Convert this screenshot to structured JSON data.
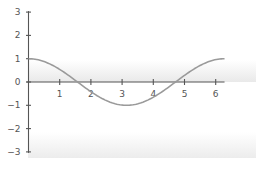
{
  "chart_data": {
    "type": "line",
    "title": "",
    "xlabel": "",
    "ylabel": "",
    "xlim": [
      0,
      6.2832
    ],
    "ylim": [
      -3,
      3
    ],
    "grid": false,
    "legend": null,
    "x_ticks": [
      "1",
      "2",
      "3",
      "4",
      "5",
      "6"
    ],
    "y_ticks": [
      "3",
      "2",
      "1",
      "0",
      "-1",
      "-2",
      "-3"
    ],
    "series": [
      {
        "name": "cos(x)",
        "x": [
          0,
          0.5,
          1,
          1.5708,
          2,
          2.5,
          3.1416,
          3.5,
          4,
          4.7124,
          5,
          5.5,
          6,
          6.2832
        ],
        "values": [
          1,
          0.878,
          0.54,
          0,
          -0.416,
          -0.801,
          -1,
          -0.936,
          -0.654,
          0,
          0.284,
          0.709,
          0.96,
          1
        ]
      }
    ]
  },
  "colors": {
    "axis": "#555555",
    "curve": "#9a9a9a",
    "label": "#555555",
    "shade": "#ececec"
  }
}
